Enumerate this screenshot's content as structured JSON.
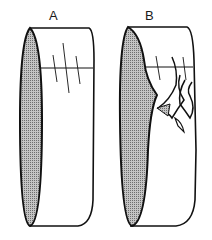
{
  "figure": {
    "panels": [
      {
        "id": "A",
        "label": "A",
        "description": "intact ring segment with reference marks"
      },
      {
        "id": "B",
        "label": "B",
        "description": "ring segment with torn / split surface"
      }
    ]
  },
  "colors": {
    "line": "#111111",
    "shade": "#a8a8a8",
    "background": "#ffffff"
  }
}
